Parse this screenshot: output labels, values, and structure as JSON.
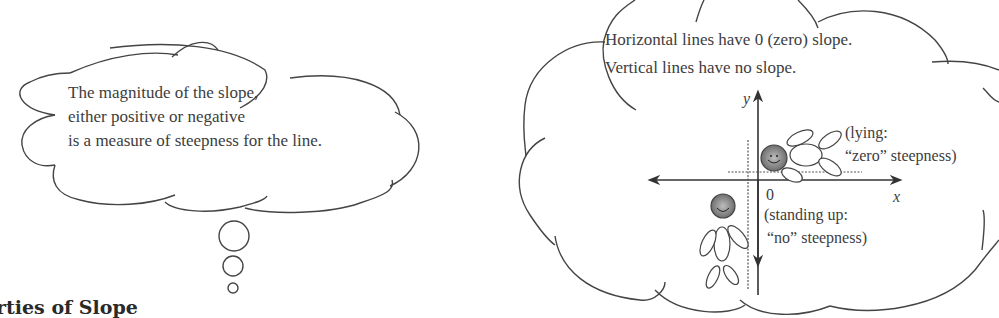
{
  "left_bubble": {
    "lines": [
      "The magnitude of the slope,",
      "either positive or negative",
      "is a measure of steepness for the line."
    ]
  },
  "right_bubble": {
    "lines": [
      "Horizontal lines have 0 (zero) slope.",
      "Vertical lines have no slope."
    ],
    "axes": {
      "x_label": "x",
      "y_label": "y",
      "origin_label": "0"
    },
    "lying_note": [
      "(lying:",
      "“zero” steepness)"
    ],
    "standing_note": [
      "(standing up:",
      "“no” steepness)"
    ]
  },
  "heading": "rties of Slope"
}
